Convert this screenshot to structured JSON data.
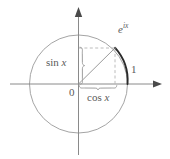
{
  "figure": {
    "colors": {
      "background": "#ffffff",
      "axis": "#8a8a8a",
      "circle": "#9a9a9a",
      "dashed": "#b0b0b0",
      "radius": "#8f8f8f",
      "arc_highlight": "#2b2b2b",
      "brace": "#9a9a9a",
      "text": "#5a5a5a"
    },
    "geometry": {
      "center": [
        78.5,
        84
      ],
      "radius": 49,
      "point_on_circle": [
        115,
        48
      ],
      "angle_degrees": 43,
      "x_axis_y": 84,
      "y_axis_x": 78.5,
      "x_axis_arrow_tip": [
        162,
        84
      ],
      "y_axis_arrow_tip": [
        78.5,
        8
      ]
    },
    "labels": {
      "point": {
        "base": "e",
        "exponent": "ix",
        "full": "e^{ix}"
      },
      "sine": {
        "fn": "sin",
        "arg": "x",
        "full": "sin x"
      },
      "cosine": {
        "fn": "cos",
        "arg": "x",
        "full": "cos x"
      },
      "unit": "1",
      "origin": "0"
    },
    "icons": {
      "x_axis_arrow": "arrow-right-icon",
      "y_axis_arrow": "arrow-up-icon",
      "sin_brace": "vertical-brace-icon",
      "cos_brace": "horizontal-brace-icon"
    }
  }
}
